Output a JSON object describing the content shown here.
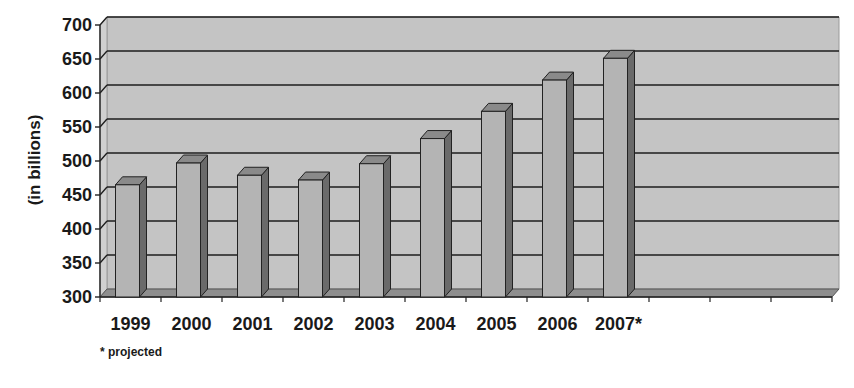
{
  "chart_data": {
    "type": "bar",
    "style": "3d-column",
    "title": "",
    "xlabel": "",
    "ylabel": "(in billions)",
    "categories": [
      "1999",
      "2000",
      "2001",
      "2002",
      "2003",
      "2004",
      "2005",
      "2006",
      "2007*"
    ],
    "values": [
      465,
      497,
      479,
      472,
      496,
      533,
      573,
      619,
      651
    ],
    "ylim": [
      300,
      700
    ],
    "yticks": [
      300,
      350,
      400,
      450,
      500,
      550,
      600,
      650,
      700
    ],
    "empty_category_slots": 3,
    "grid": true,
    "legend": "none",
    "annotations": [
      "* projected"
    ]
  },
  "footnote": "* projected",
  "colors": {
    "wall": "#c4c4c4",
    "floor": "#8e8e8e",
    "bar_front": "#b4b4b4",
    "bar_top": "#8a8a8a",
    "bar_side": "#6a6a6a",
    "gridline": "#1e1e1e",
    "text": "#1a1a1a"
  }
}
